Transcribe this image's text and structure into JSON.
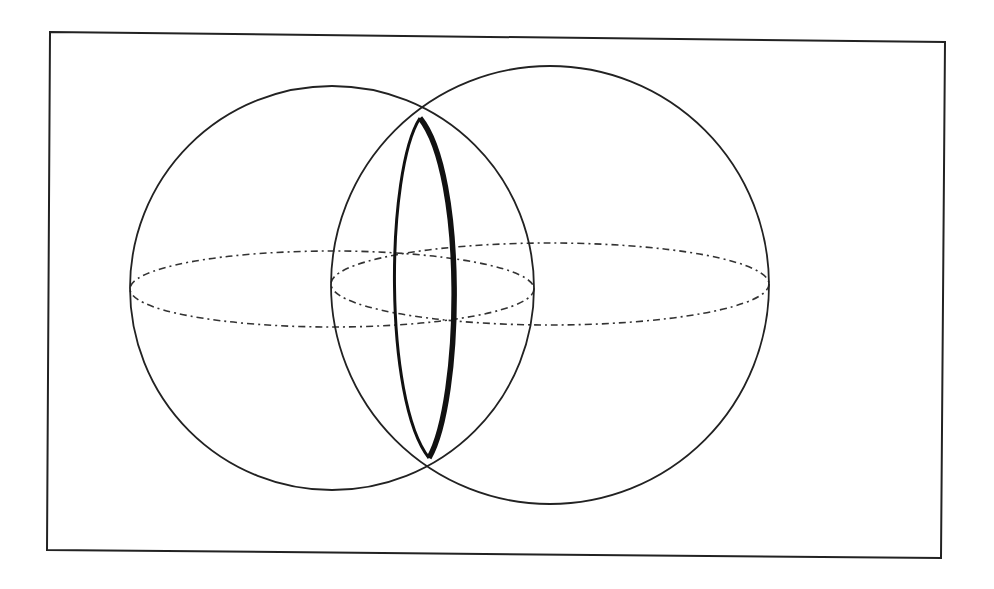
{
  "figure": {
    "background": "#ffffff",
    "stroke_color": "#222222",
    "frame": {
      "points": "50,32 945,42 941,558 47,550",
      "stroke_width": 2
    },
    "spheres": [
      {
        "name": "left-sphere",
        "cx": 332,
        "cy": 288,
        "r": 202,
        "equator": {
          "cx": 332,
          "cy": 289,
          "rx": 202,
          "ry": 38
        }
      },
      {
        "name": "right-sphere",
        "cx": 550,
        "cy": 285,
        "r": 219,
        "equator": {
          "cx": 550,
          "cy": 284,
          "rx": 219,
          "ry": 41
        }
      }
    ],
    "intersection": {
      "top": {
        "x": 420,
        "y": 118
      },
      "bottom": {
        "x": 429,
        "y": 458
      },
      "back_side_path": "M420,118 C386,170 383,400 429,458",
      "front_side_path": "M420,118 C466,175 462,400 429,458",
      "back_stroke_width": 3,
      "front_stroke_width": 5.5
    },
    "equator_dash": "7 4 2 4"
  }
}
